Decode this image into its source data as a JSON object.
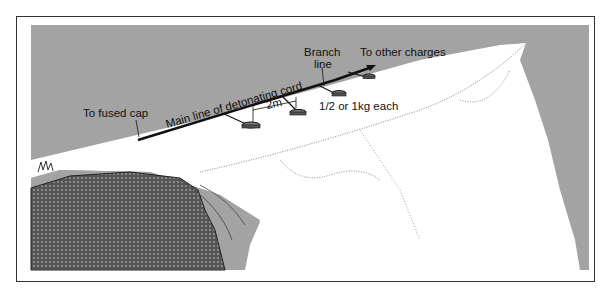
{
  "diagram": {
    "type": "illustration",
    "labels": {
      "fused_cap": "To fused cap",
      "main_line": "Main line of detonating cord",
      "spacing": "2m",
      "branch_line_1": "Branch",
      "branch_line_2": "line",
      "other_charges": "To other charges",
      "charge_weight": "1/2 or 1kg each"
    },
    "colors": {
      "sky_gray": "#a3a3a3",
      "snow": "#ffffff",
      "cord": "#111111",
      "frame": "#333333"
    }
  }
}
